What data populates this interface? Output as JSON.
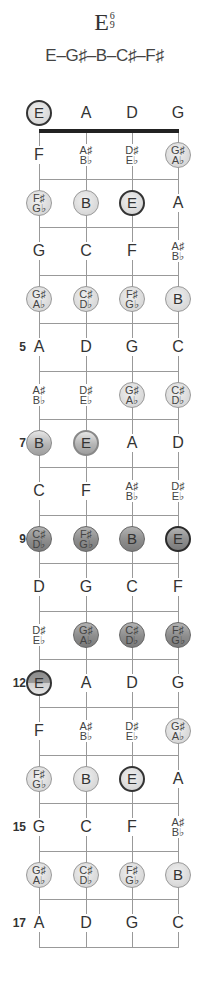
{
  "chord": {
    "root": "E",
    "extension_top": "6",
    "extension_bottom": "9",
    "notes": "E–G♯–B–C♯–F♯"
  },
  "strings": [
    "E",
    "A",
    "D",
    "G"
  ],
  "fret_labels": [
    {
      "fret": 5,
      "label": "5"
    },
    {
      "fret": 7,
      "label": "7"
    },
    {
      "fret": 9,
      "label": "9"
    },
    {
      "fret": 12,
      "label": "12"
    },
    {
      "fret": 15,
      "label": "15"
    },
    {
      "fret": 17,
      "label": "17"
    }
  ],
  "rows": [
    [
      {
        "n": "E",
        "s": "root"
      },
      {
        "n": "A"
      },
      {
        "n": "D"
      },
      {
        "n": "G"
      }
    ],
    [
      {
        "n": "F"
      },
      {
        "n": "A♯|B♭"
      },
      {
        "n": "D♯|E♭"
      },
      {
        "n": "G♯|A♭",
        "s": "light"
      }
    ],
    [
      {
        "n": "F♯|G♭",
        "s": "light"
      },
      {
        "n": "B",
        "s": "light"
      },
      {
        "n": "E",
        "s": "root"
      },
      {
        "n": "A"
      }
    ],
    [
      {
        "n": "G"
      },
      {
        "n": "C"
      },
      {
        "n": "F"
      },
      {
        "n": "A♯|B♭"
      }
    ],
    [
      {
        "n": "G♯|A♭",
        "s": "light"
      },
      {
        "n": "C♯|D♭",
        "s": "light"
      },
      {
        "n": "F♯|G♭",
        "s": "light"
      },
      {
        "n": "B",
        "s": "light"
      }
    ],
    [
      {
        "n": "A"
      },
      {
        "n": "D"
      },
      {
        "n": "G"
      },
      {
        "n": "C"
      }
    ],
    [
      {
        "n": "A♯|B♭"
      },
      {
        "n": "D♯|E♭"
      },
      {
        "n": "G♯|A♭",
        "s": "light"
      },
      {
        "n": "C♯|D♭",
        "s": "light"
      }
    ],
    [
      {
        "n": "B",
        "s": "mid"
      },
      {
        "n": "E",
        "s": "mid-root"
      },
      {
        "n": "A"
      },
      {
        "n": "D"
      }
    ],
    [
      {
        "n": "C"
      },
      {
        "n": "F"
      },
      {
        "n": "A♯|B♭"
      },
      {
        "n": "D♯|E♭"
      }
    ],
    [
      {
        "n": "C♯|D♭",
        "s": "dark"
      },
      {
        "n": "F♯|G♭",
        "s": "dark"
      },
      {
        "n": "B",
        "s": "dark"
      },
      {
        "n": "E",
        "s": "dark-root"
      }
    ],
    [
      {
        "n": "D"
      },
      {
        "n": "G"
      },
      {
        "n": "C"
      },
      {
        "n": "F"
      }
    ],
    [
      {
        "n": "D♯|E♭"
      },
      {
        "n": "G♯|A♭",
        "s": "dark"
      },
      {
        "n": "C♯|D♭",
        "s": "dark"
      },
      {
        "n": "F♯|G♭",
        "s": "dark"
      }
    ],
    [
      {
        "n": "E",
        "s": "half-root"
      },
      {
        "n": "A"
      },
      {
        "n": "D"
      },
      {
        "n": "G"
      }
    ],
    [
      {
        "n": "F"
      },
      {
        "n": "A♯|B♭"
      },
      {
        "n": "D♯|E♭"
      },
      {
        "n": "G♯|A♭",
        "s": "light"
      }
    ],
    [
      {
        "n": "F♯|G♭",
        "s": "light"
      },
      {
        "n": "B",
        "s": "light"
      },
      {
        "n": "E",
        "s": "root"
      },
      {
        "n": "A"
      }
    ],
    [
      {
        "n": "G"
      },
      {
        "n": "C"
      },
      {
        "n": "F"
      },
      {
        "n": "A♯|B♭"
      }
    ],
    [
      {
        "n": "G♯|A♭",
        "s": "light"
      },
      {
        "n": "C♯|D♭",
        "s": "light"
      },
      {
        "n": "F♯|G♭",
        "s": "light"
      },
      {
        "n": "B",
        "s": "light"
      }
    ],
    [
      {
        "n": "A"
      },
      {
        "n": "D"
      },
      {
        "n": "G"
      },
      {
        "n": "C"
      }
    ]
  ],
  "colors": {
    "nut": "#222222",
    "line": "#999999",
    "dot_light": "#dcdcdc",
    "dot_mid": "#b0b0b0",
    "dot_dark": "#8a8a8a",
    "root_border": "#333333"
  }
}
